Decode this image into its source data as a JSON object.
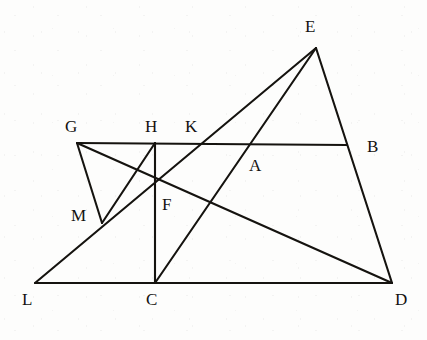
{
  "figure": {
    "background_color": "#fdfdfc",
    "stroke_color": "#15130f",
    "label_color": "#141210",
    "width": 427,
    "height": 340,
    "points": [
      {
        "id": "E",
        "name": "point-e",
        "x": 316,
        "y": 48,
        "label": "E",
        "label_x": 305,
        "label_y": 18
      },
      {
        "id": "G",
        "name": "point-g",
        "x": 77,
        "y": 143,
        "label": "G",
        "label_x": 65,
        "label_y": 118
      },
      {
        "id": "H",
        "name": "point-h",
        "x": 155,
        "y": 143,
        "label": "H",
        "label_x": 145,
        "label_y": 118
      },
      {
        "id": "K",
        "name": "point-k",
        "x": 200,
        "y": 144,
        "label": "K",
        "label_x": 185,
        "label_y": 118
      },
      {
        "id": "B",
        "name": "point-b",
        "x": 347,
        "y": 145,
        "label": "B",
        "label_x": 367,
        "label_y": 138
      },
      {
        "id": "A",
        "name": "point-a",
        "x": 250,
        "y": 145,
        "label": "A",
        "label_x": 249,
        "label_y": 157
      },
      {
        "id": "M",
        "name": "point-m",
        "x": 102,
        "y": 223,
        "label": "M",
        "label_x": 71,
        "label_y": 207
      },
      {
        "id": "F",
        "name": "point-f",
        "x": 155,
        "y": 187,
        "label": "F",
        "label_x": 162,
        "label_y": 196
      },
      {
        "id": "L",
        "name": "point-l",
        "x": 35,
        "y": 283,
        "label": "L",
        "label_x": 22,
        "label_y": 291
      },
      {
        "id": "C",
        "name": "point-c",
        "x": 155,
        "y": 283,
        "label": "C",
        "label_x": 146,
        "label_y": 291
      },
      {
        "id": "D",
        "name": "point-d",
        "x": 392,
        "y": 283,
        "label": "D",
        "label_x": 395,
        "label_y": 291
      }
    ],
    "segments": [
      {
        "name": "segment-l-d-base",
        "from": "L",
        "to": "D",
        "description": "base line L to D"
      },
      {
        "name": "segment-l-e-through-m-f-k",
        "from": "L",
        "to": "E",
        "description": "line from L through M, F and K up to E"
      },
      {
        "name": "segment-g-b-horizontal",
        "from": "G",
        "to": "B",
        "description": "horizontal line G to B"
      },
      {
        "name": "segment-g-m",
        "from": "G",
        "to": "M",
        "description": "line from G down to M"
      },
      {
        "name": "segment-g-d-through-f",
        "from": "G",
        "to": "D",
        "description": "line from G through F to D"
      },
      {
        "name": "segment-h-c-vertical",
        "from": "H",
        "to": "C",
        "description": "vertical line H to C"
      },
      {
        "name": "segment-c-e-through-a",
        "from": "C",
        "to": "E",
        "description": "line from C through A up to E"
      },
      {
        "name": "segment-e-d",
        "from": "E",
        "to": "D",
        "description": "line from E down to D"
      },
      {
        "name": "segment-m-h",
        "from": "M",
        "to": "H",
        "description": "line from M up to H"
      }
    ]
  }
}
